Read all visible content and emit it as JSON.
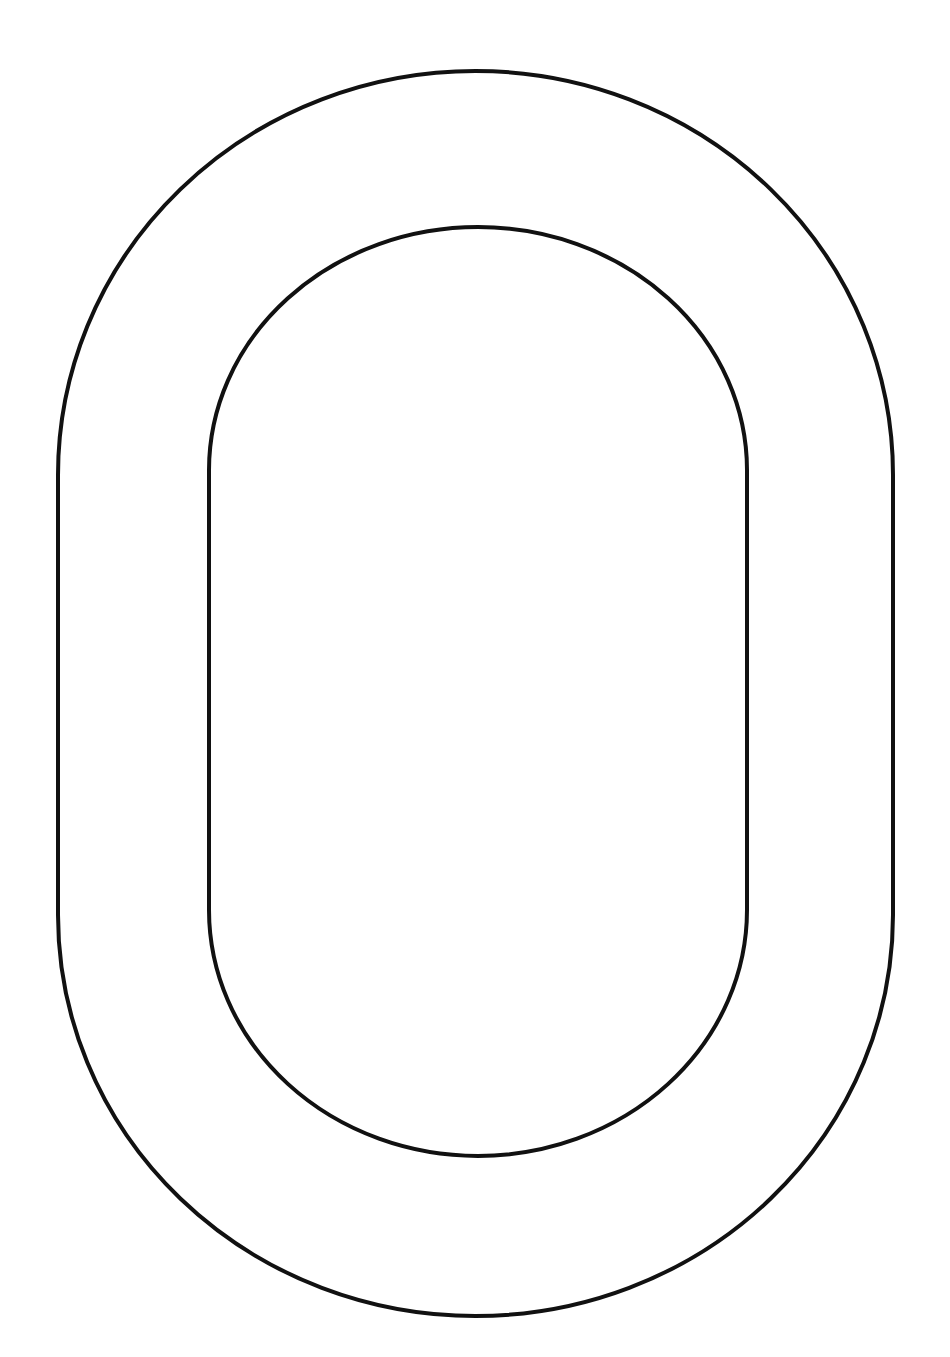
{
  "drawing": {
    "subject": "letter-O-outline",
    "background": "#ffffff",
    "stroke_color": "#111111",
    "stroke_width": 4,
    "outer_shape": {
      "left": 58,
      "right": 893,
      "top": 71,
      "bottom": 1316,
      "straight_top": 475,
      "straight_bottom": 915
    },
    "inner_shape": {
      "left": 209,
      "right": 747,
      "top": 227,
      "bottom": 1156,
      "straight_top": 470,
      "straight_bottom": 910
    }
  }
}
